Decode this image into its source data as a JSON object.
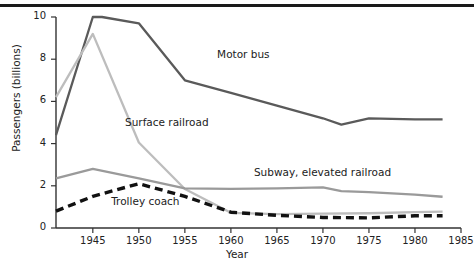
{
  "chart_data": {
    "type": "line",
    "title": "",
    "xlabel": "Year",
    "ylabel": "Passengers (billions)",
    "xlim": [
      1941,
      1985
    ],
    "ylim": [
      0,
      10
    ],
    "xticks": [
      1945,
      1950,
      1955,
      1960,
      1965,
      1970,
      1975,
      1980,
      1985
    ],
    "xtick_labels": [
      "1945",
      "1950",
      "1955",
      "1960",
      "1965",
      "1970",
      "1975",
      "1980",
      "1985"
    ],
    "yticks": [
      0,
      2,
      4,
      6,
      8,
      10
    ],
    "ytick_labels": [
      "0",
      "2",
      "4",
      "6",
      "8",
      "10"
    ],
    "grid": false,
    "legend": "inline-annotations",
    "series": [
      {
        "name": "Motor bus",
        "color": "#5a5a5a",
        "style": "solid",
        "x": [
          1941,
          1945,
          1946,
          1950,
          1955,
          1960,
          1965,
          1970,
          1972,
          1975,
          1980,
          1983
        ],
        "values": [
          4.4,
          10.0,
          10.0,
          9.7,
          7.0,
          6.4,
          5.8,
          5.2,
          4.9,
          5.2,
          5.15,
          5.15
        ]
      },
      {
        "name": "Surface railroad",
        "color": "#bdbdbd",
        "style": "solid",
        "x": [
          1941,
          1945,
          1950,
          1955,
          1960,
          1965,
          1970,
          1975,
          1980,
          1983
        ],
        "values": [
          6.2,
          9.2,
          4.05,
          1.85,
          0.72,
          0.66,
          0.68,
          0.7,
          0.75,
          0.78
        ]
      },
      {
        "name": "Subway, elevated railroad",
        "color": "#9a9a9a",
        "style": "solid",
        "x": [
          1941,
          1945,
          1950,
          1955,
          1960,
          1965,
          1970,
          1972,
          1975,
          1980,
          1983
        ],
        "values": [
          2.35,
          2.8,
          2.35,
          1.88,
          1.85,
          1.88,
          1.93,
          1.75,
          1.7,
          1.58,
          1.48
        ]
      },
      {
        "name": "Trolley coach",
        "color": "#111111",
        "style": "dashed",
        "x": [
          1941,
          1945,
          1950,
          1955,
          1960,
          1965,
          1970,
          1975,
          1980,
          1983
        ],
        "values": [
          0.8,
          1.5,
          2.1,
          1.5,
          0.75,
          0.6,
          0.5,
          0.48,
          0.58,
          0.58
        ]
      }
    ],
    "annotations": [
      {
        "text": "Motor bus",
        "x": 1958.5,
        "y": 8.2
      },
      {
        "text": "Surface railroad",
        "x": 1948.5,
        "y": 5.0
      },
      {
        "text": "Subway, elevated railroad",
        "x": 1962.5,
        "y": 2.6
      },
      {
        "text": "Trolley coach",
        "x": 1947.0,
        "y": 1.25
      }
    ]
  }
}
